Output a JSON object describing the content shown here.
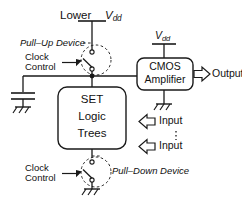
{
  "figure": {
    "type": "circuit-block-diagram"
  },
  "labels": {
    "lower_vdd": "Lower",
    "vdd_top": "V",
    "vdd_sub": "dd",
    "vdd_amp": "V",
    "vdd_amp_sub": "dd",
    "pull_up_device": "Pull–Up Device",
    "clock_control_top_line1": "Clock",
    "clock_control_top_line2": "Control",
    "clock_control_bottom_line1": "Clock",
    "clock_control_bottom_line2": "Control",
    "pull_down_device": "Pull–Down Device",
    "set_block_line1": "SET",
    "set_block_line2": "Logic",
    "set_block_line3": "Trees",
    "amp_block_line1": "CMOS",
    "amp_block_line2": "Amplifier",
    "output": "Output",
    "input_top": "Input",
    "input_bottom": "Input",
    "vertical_ellipsis": "⋮"
  },
  "colors": {
    "stroke": "#1a1a1a",
    "text": "#111111",
    "background": "#ffffff",
    "dashed": "#2a2a2a"
  },
  "components": [
    {
      "name": "lower-vdd-supply",
      "kind": "supply-rail"
    },
    {
      "name": "pull-up-device",
      "kind": "set-switch",
      "annotation": "Pull–Up Device"
    },
    {
      "name": "storage-capacitor",
      "kind": "capacitor"
    },
    {
      "name": "ground-capacitor",
      "kind": "ground"
    },
    {
      "name": "set-logic-trees",
      "kind": "block"
    },
    {
      "name": "pull-down-device",
      "kind": "set-switch",
      "annotation": "Pull–Down Device"
    },
    {
      "name": "ground-pull-down",
      "kind": "ground"
    },
    {
      "name": "cmos-amplifier",
      "kind": "block"
    },
    {
      "name": "vdd-amplifier-supply",
      "kind": "supply-rail"
    },
    {
      "name": "ground-amplifier",
      "kind": "ground"
    },
    {
      "name": "output-arrow",
      "kind": "arrow"
    },
    {
      "name": "input-arrow-top",
      "kind": "arrow"
    },
    {
      "name": "input-arrow-bottom",
      "kind": "arrow"
    },
    {
      "name": "node-junction",
      "kind": "junction-dot"
    }
  ]
}
